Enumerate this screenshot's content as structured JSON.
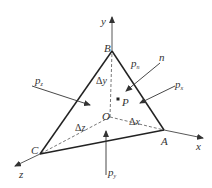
{
  "diagram": {
    "type": "tetrahedron-stress-element",
    "axes": {
      "x": "x",
      "y": "y",
      "z": "z"
    },
    "vertices": {
      "origin": "O",
      "a": "A",
      "b": "B",
      "c": "C"
    },
    "point": "P",
    "edge_lengths": {
      "dx": "Δx",
      "dy": "Δy",
      "dz": "Δz"
    },
    "normal": "n",
    "stresses": {
      "pn": {
        "base": "p",
        "sub": "n"
      },
      "px": {
        "base": "p",
        "sub": "x"
      },
      "py": {
        "base": "p",
        "sub": "y"
      },
      "pz": {
        "base": "p",
        "sub": "z"
      }
    }
  }
}
